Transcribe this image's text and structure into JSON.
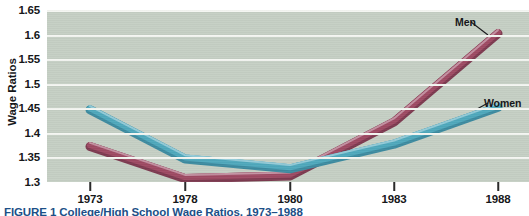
{
  "figure": {
    "caption_label": "FIGURE 1",
    "caption_text": "College/High School Wage Ratios, 1973–1988",
    "caption_full": "FIGURE 1   College/High School Wage Ratios, 1973–1988"
  },
  "colors": {
    "plot_background": "#c5cfc4",
    "gridline": "#f4f6f2",
    "men_line": "#9e4a63",
    "men_line_light": "#c08b9c",
    "women_line": "#4fa8bc",
    "women_line_light": "#8fc9d6",
    "axis_text": "#16171a",
    "caption_text": "#1c4f87"
  },
  "annotations": {
    "men": "Men",
    "women": "Women"
  },
  "chart_data": {
    "type": "line",
    "title": "College/High School Wage Ratios, 1973–1988",
    "xlabel": "",
    "ylabel": "Wage Ratios",
    "categories": [
      "1973",
      "1978",
      "1980",
      "1983",
      "1988"
    ],
    "x": [
      1973,
      1978,
      1980,
      1983,
      1988
    ],
    "xtick_labels": [
      "1973",
      "1978",
      "1980",
      "1983",
      "1988"
    ],
    "ytick_labels": [
      "1.3",
      "1.35",
      "1.4",
      "1.45",
      "1.5",
      "1.55",
      "1.6",
      "1.65"
    ],
    "yticks": [
      1.3,
      1.35,
      1.4,
      1.45,
      1.5,
      1.55,
      1.6,
      1.65
    ],
    "ylim": [
      1.3,
      1.65
    ],
    "grid": "horizontal",
    "legend_position": "inline-annotations",
    "series": [
      {
        "name": "Men",
        "color": "#9e4a63",
        "values": [
          1.375,
          1.31,
          1.315,
          1.425,
          1.605
        ]
      },
      {
        "name": "Women",
        "color": "#4fa8bc",
        "values": [
          1.45,
          1.35,
          1.33,
          1.38,
          1.455
        ]
      }
    ]
  }
}
